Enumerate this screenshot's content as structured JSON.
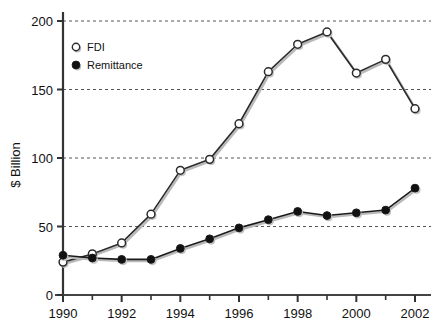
{
  "chart_data": {
    "type": "line",
    "title": "",
    "subtitle": "",
    "xlabel": "",
    "ylabel": "$ Billion",
    "xlim": [
      1990,
      2002
    ],
    "ylim": [
      0,
      200
    ],
    "grid": true,
    "grid_axis": "y",
    "legend_position": "top-left",
    "x": [
      1990,
      1991,
      1992,
      1993,
      1994,
      1995,
      1996,
      1997,
      1998,
      1999,
      2000,
      2001,
      2002
    ],
    "xtick_labels": [
      "1990",
      "1992",
      "1994",
      "1996",
      "1998",
      "2000",
      "2002"
    ],
    "xtick_values": [
      1990,
      1992,
      1994,
      1996,
      1998,
      2000,
      2002
    ],
    "xminor_tick_values": [
      1991,
      1993,
      1995,
      1997,
      1999,
      2001
    ],
    "ytick_labels": [
      "0",
      "50",
      "100",
      "150",
      "200"
    ],
    "ytick_values": [
      0,
      50,
      100,
      150,
      200
    ],
    "series": [
      {
        "name": "FDI",
        "marker": "open-circle",
        "color": "#2b2b2b",
        "marker_fill": "#ffffff",
        "values": [
          24,
          30,
          38,
          59,
          91,
          99,
          125,
          163,
          183,
          192,
          162,
          172,
          136
        ]
      },
      {
        "name": "Remittance",
        "marker": "filled-circle",
        "color": "#1a1a1a",
        "marker_fill": "#111111",
        "values": [
          29,
          27,
          26,
          26,
          34,
          41,
          49,
          55,
          61,
          58,
          60,
          62,
          78
        ]
      }
    ]
  },
  "legend": {
    "items": [
      {
        "label": "FDI"
      },
      {
        "label": "Remittance"
      }
    ]
  },
  "axes": {
    "y_title": "$ Billion"
  }
}
